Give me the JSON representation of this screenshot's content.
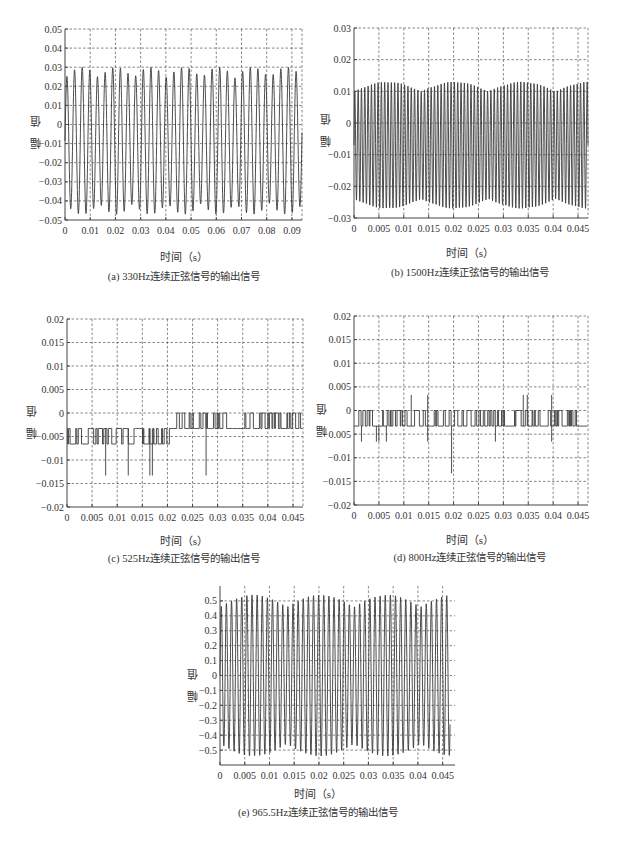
{
  "chart_data": [
    {
      "id": "a",
      "type": "line",
      "caption": "(a) 330Hz连续正弦信号的输出信号",
      "title": "",
      "xlabel": "时间（s）",
      "ylabel": "幅 值",
      "xlim": [
        0,
        0.094
      ],
      "ylim": [
        -0.05,
        0.05
      ],
      "xticks": [
        0,
        0.01,
        0.02,
        0.03,
        0.04,
        0.05,
        0.06,
        0.07,
        0.08,
        0.09
      ],
      "xtick_labels": [
        "0",
        "0.01",
        "0.02",
        "0.03",
        "0.04",
        "0.05",
        "0.06",
        "0.07",
        "0.08",
        "0.09"
      ],
      "yticks": [
        0.05,
        0.04,
        0.03,
        0.02,
        0.01,
        0,
        -0.01,
        -0.02,
        -0.03,
        -0.04,
        -0.05
      ],
      "ytick_labels": [
        "0.05",
        "0.04",
        "0.03",
        "0.02",
        "0.01",
        "0",
        "-0.01",
        "-0.02",
        "-0.03",
        "-0.04",
        "-0.05"
      ],
      "grid": true,
      "box": true,
      "signal": {
        "kind": "sine",
        "freq_hz": 330,
        "cycles_shown": 31,
        "max": 0.03,
        "min": -0.047,
        "typical_peak": 0.026,
        "typical_trough": -0.04,
        "offset": -0.005
      },
      "frame": {
        "left": 65,
        "top": 29,
        "right": 302,
        "bottom": 220
      }
    },
    {
      "id": "b",
      "type": "line",
      "caption": "(b) 1500Hz连续正弦信号的输出信号",
      "title": "",
      "xlabel": "时间（s）",
      "ylabel": "幅 值",
      "xlim": [
        0,
        0.047
      ],
      "ylim": [
        -0.03,
        0.03
      ],
      "xticks": [
        0,
        0.005,
        0.01,
        0.015,
        0.02,
        0.025,
        0.03,
        0.035,
        0.04,
        0.045
      ],
      "xtick_labels": [
        "0",
        "0.005",
        "0.01",
        "0.015",
        "0.02",
        "0.025",
        "0.03",
        "0.035",
        "0.04",
        "0.045"
      ],
      "yticks": [
        0.03,
        0.02,
        0.01,
        0,
        -0.01,
        -0.02,
        -0.03
      ],
      "ytick_labels": [
        "0.03",
        "0.02",
        "0.01",
        "0",
        "-0.01",
        "-0.02",
        "-0.03"
      ],
      "grid": true,
      "box": true,
      "signal": {
        "kind": "sine",
        "freq_hz": 1500,
        "cycles_shown": 70,
        "max": 0.013,
        "min": -0.027,
        "offset": -0.007
      },
      "frame": {
        "left": 354,
        "top": 28,
        "right": 588,
        "bottom": 218
      }
    },
    {
      "id": "c",
      "type": "line",
      "caption": "(c) 525Hz连续正弦信号的输出信号",
      "title": "",
      "xlabel": "时间（s）",
      "ylabel": "幅 值",
      "xlim": [
        0,
        0.047
      ],
      "ylim": [
        -0.02,
        0.02
      ],
      "xticks": [
        0,
        0.005,
        0.01,
        0.015,
        0.02,
        0.025,
        0.03,
        0.035,
        0.04,
        0.045
      ],
      "xtick_labels": [
        "0",
        "0.005",
        "0.01",
        "0.015",
        "0.02",
        "0.025",
        "0.03",
        "0.035",
        "0.04",
        "0.045"
      ],
      "yticks": [
        0.02,
        0.015,
        0.01,
        0.005,
        0,
        -0.005,
        -0.01,
        -0.015,
        -0.02
      ],
      "ytick_labels": [
        "0.02",
        "0.015",
        "0.01",
        "0.005",
        "0",
        "-0.005",
        "-0.01",
        "-0.015",
        "-0.02"
      ],
      "grid": true,
      "box": true,
      "signal": {
        "kind": "quantized",
        "levels": [
          0,
          -0.0033,
          -0.0066
        ],
        "spikes": [
          [
            0.0077,
            -0.0133
          ],
          [
            0.0122,
            -0.0133
          ],
          [
            0.0165,
            -0.0133
          ],
          [
            0.017,
            -0.0133
          ],
          [
            0.0277,
            -0.0133
          ]
        ],
        "up_from_t": 0.021
      },
      "frame": {
        "left": 67,
        "top": 319,
        "right": 303,
        "bottom": 507
      }
    },
    {
      "id": "d",
      "type": "line",
      "caption": "(d) 800Hz连续正弦信号的输出信号",
      "title": "",
      "xlabel": "时间（s）",
      "ylabel": "幅 值",
      "xlim": [
        0,
        0.047
      ],
      "ylim": [
        -0.02,
        0.02
      ],
      "xticks": [
        0,
        0.005,
        0.01,
        0.015,
        0.02,
        0.025,
        0.03,
        0.035,
        0.04,
        0.045
      ],
      "xtick_labels": [
        "0",
        "0.005",
        "0.01",
        "0.015",
        "0.02",
        "0.025",
        "0.03",
        "0.035",
        "0.04",
        "0.045"
      ],
      "yticks": [
        0.02,
        0.015,
        0.01,
        0.005,
        0,
        -0.005,
        -0.01,
        -0.015,
        -0.02
      ],
      "ytick_labels": [
        "0.02",
        "0.015",
        "0.01",
        "0.005",
        "0",
        "-0.005",
        "-0.01",
        "-0.015",
        "-0.02"
      ],
      "grid": true,
      "box": true,
      "signal": {
        "kind": "quantized",
        "levels": [
          0,
          -0.0033
        ],
        "spikes": [
          [
            0.0015,
            -0.0066
          ],
          [
            0.0045,
            -0.0066
          ],
          [
            0.005,
            -0.0066
          ],
          [
            0.0065,
            -0.0066
          ],
          [
            0.0115,
            0.0033
          ],
          [
            0.0148,
            0.0033
          ],
          [
            0.0148,
            -0.0066
          ],
          [
            0.0196,
            -0.0133
          ],
          [
            0.0284,
            -0.0066
          ],
          [
            0.034,
            0.0033
          ],
          [
            0.0348,
            0.0033
          ],
          [
            0.0397,
            0.0033
          ],
          [
            0.0397,
            -0.0066
          ]
        ]
      },
      "frame": {
        "left": 354,
        "top": 316,
        "right": 588,
        "bottom": 505
      }
    },
    {
      "id": "e",
      "type": "line",
      "caption": "(e) 965.5Hz连续正弦信号的输出信号",
      "title": "",
      "xlabel": "时间（s）",
      "ylabel": "幅 值",
      "xlim": [
        0,
        0.0475
      ],
      "ylim": [
        -0.6,
        0.6
      ],
      "xticks": [
        0,
        0.005,
        0.01,
        0.015,
        0.02,
        0.025,
        0.03,
        0.035,
        0.04,
        0.045
      ],
      "xtick_labels": [
        "0",
        "0.005",
        "0.01",
        "0.015",
        "0.02",
        "0.025",
        "0.03",
        "0.035",
        "0.04",
        "0.045"
      ],
      "yticks": [
        0.5,
        0.4,
        0.3,
        0.2,
        0.1,
        0,
        -0.1,
        -0.2,
        -0.3,
        -0.4,
        -0.5
      ],
      "ytick_labels": [
        "0.5",
        "0.4",
        "0.3",
        "0.2",
        "0.1",
        "0",
        "-0.1",
        "-0.2",
        "-0.3",
        "-0.4",
        "-0.5"
      ],
      "grid": true,
      "box": false,
      "signal": {
        "kind": "sine",
        "freq_hz": 965.5,
        "cycles_shown": 45,
        "max": 0.54,
        "min": -0.54,
        "offset": 0,
        "t_end": 0.0465
      },
      "frame": {
        "left": 220,
        "top": 586,
        "right": 455,
        "bottom": 765
      }
    }
  ],
  "colors": {
    "trace": "#3a3a3a",
    "grid": "#555555",
    "axis": "#444444",
    "text": "#333333"
  }
}
